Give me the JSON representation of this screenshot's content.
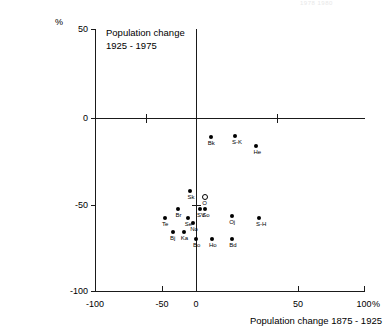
{
  "top_clipped_text": "1978  1980",
  "chart_data": {
    "type": "scatter",
    "title": "Population change\n1925 - 1975",
    "xlabel": "Population change  1875 - 1925",
    "ylabel": "",
    "y_unit": "%",
    "x_unit": "%",
    "xlim": [
      -100,
      100
    ],
    "ylim": [
      -100,
      50
    ],
    "xticks": [
      -100,
      -50,
      0,
      50,
      100
    ],
    "xticklabels": [
      "-100",
      "-50",
      "0",
      "50",
      "100"
    ],
    "yticks": [
      50,
      0,
      -50,
      -100
    ],
    "yticklabels": [
      "50",
      "0",
      "-50",
      "-100"
    ],
    "grid": false,
    "legend": "none",
    "points": [
      {
        "label": "Bk",
        "x": -14,
        "y": -12,
        "marker": "filled"
      },
      {
        "label": "S-K",
        "x": 4,
        "y": -11,
        "marker": "filled"
      },
      {
        "label": "He",
        "x": 20,
        "y": -17,
        "marker": "filled"
      },
      {
        "label": "Sk",
        "x": -29,
        "y": -43,
        "marker": "filled"
      },
      {
        "label": "O",
        "x": -18,
        "y": -46,
        "marker": "open"
      },
      {
        "label": "Br",
        "x": -38,
        "y": -53,
        "marker": "filled"
      },
      {
        "label": "SV",
        "x": -22,
        "y": -53,
        "marker": "filled"
      },
      {
        "label": "So",
        "x": -18,
        "y": -53,
        "marker": "filled"
      },
      {
        "label": "Se",
        "x": -31,
        "y": -58,
        "marker": "filled"
      },
      {
        "label": "Te",
        "x": -48,
        "y": -58,
        "marker": "filled"
      },
      {
        "label": "No",
        "x": -27,
        "y": -61,
        "marker": "filled"
      },
      {
        "label": "Oj",
        "x": 2,
        "y": -57,
        "marker": "filled"
      },
      {
        "label": "S-H",
        "x": 22,
        "y": -58,
        "marker": "filled"
      },
      {
        "label": "Bj",
        "x": -42,
        "y": -66,
        "marker": "filled"
      },
      {
        "label": "Ka",
        "x": -34,
        "y": -66,
        "marker": "filled"
      },
      {
        "label": "Bo",
        "x": -25,
        "y": -70,
        "marker": "filled"
      },
      {
        "label": "Ho",
        "x": -13,
        "y": -70,
        "marker": "filled"
      },
      {
        "label": "Bd",
        "x": 2,
        "y": -70,
        "marker": "filled"
      }
    ]
  }
}
